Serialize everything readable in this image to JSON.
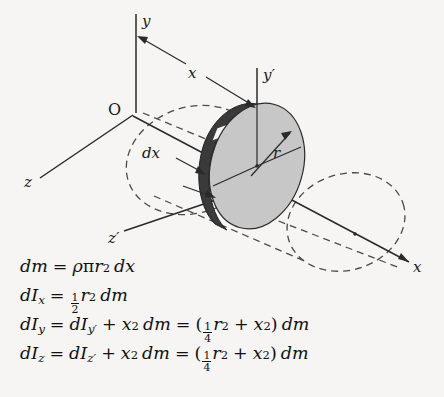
{
  "figure": {
    "kind": "3d-engineering-diagram",
    "background_color": "#f6f5f3",
    "ink_color": "#1a1a1a",
    "disk_face_color": "#c7c7c7",
    "disk_rim_color": "#3a3a3a",
    "axes": [
      {
        "name": "y",
        "label": "y",
        "primed": false,
        "orientation": "vertical-up"
      },
      {
        "name": "z",
        "label": "z",
        "primed": false,
        "orientation": "lower-left"
      },
      {
        "name": "x",
        "label": "x",
        "primed": false,
        "orientation": "lower-right"
      },
      {
        "name": "y-prime",
        "label": "y′",
        "primed": true,
        "orientation": "vertical-up"
      },
      {
        "name": "z-prime",
        "label": "z′",
        "primed": true,
        "orientation": "lower-left"
      }
    ],
    "origin_label": "O",
    "dimension_labels": [
      {
        "name": "distance-x",
        "label": "x",
        "description": "distance from origin plane to disk plane"
      },
      {
        "name": "thickness-dx",
        "label": "dx",
        "description": "differential thickness of disk"
      },
      {
        "name": "radius-r",
        "label": "r",
        "description": "radius of disk"
      }
    ]
  },
  "equations": [
    {
      "name": "dm",
      "lhs": {
        "d": "d",
        "var": "m"
      },
      "parts": [
        "dm",
        "=",
        "ρπr² dx"
      ],
      "plain": "dm = ρπr² dx"
    },
    {
      "name": "dIx",
      "plain": "dI_x = ½ r² dm",
      "fraction": {
        "num": "1",
        "den": "2"
      }
    },
    {
      "name": "dIy",
      "plain": "dI_y = dI_y′ + x² dm = (¼ r² + x²) dm",
      "fraction": {
        "num": "1",
        "den": "4"
      }
    },
    {
      "name": "dIz",
      "plain": "dI_z = dI_z′ + x² dm = (¼ r² + x²) dm",
      "fraction": {
        "num": "1",
        "den": "4"
      }
    }
  ],
  "symbols": {
    "d": "d",
    "I": "I",
    "m": "m",
    "r": "r",
    "x": "x",
    "y": "y",
    "z": "z",
    "rho": "ρ",
    "pi": "π",
    "equals": "=",
    "plus": "+",
    "lparen": "(",
    "rparen": ")",
    "prime": "′",
    "sq": "2",
    "sub_x": "x",
    "sub_y": "y",
    "sub_z": "z",
    "sub_yp": "y′",
    "sub_zp": "z′",
    "one": "1",
    "two": "2",
    "four": "4"
  }
}
